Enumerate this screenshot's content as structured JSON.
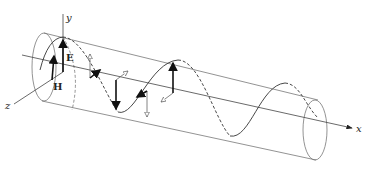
{
  "diagram": {
    "title": "",
    "axes": {
      "x_label": "x",
      "y_label": "y",
      "z_label": "z"
    },
    "vectors": {
      "electric_label": "E",
      "magnetic_label": "H"
    },
    "colors": {
      "line": "#555555",
      "solid_arrow": "#111111",
      "hollow_arrow": "#ffffff",
      "background": "#ffffff"
    }
  }
}
